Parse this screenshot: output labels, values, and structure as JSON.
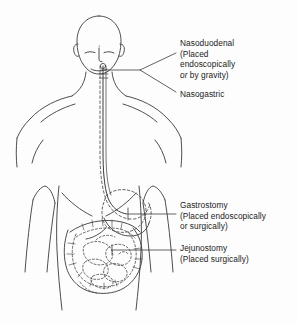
{
  "figure": {
    "background_color": "#fdfdfd",
    "ink_color": "#3a3a3a",
    "text_color": "#1a1a1a"
  },
  "labels": {
    "nasoduodenal": {
      "name": "Nasoduodenal",
      "detail_line1": "(Placed",
      "detail_line2": "endoscopically",
      "detail_italic": "or",
      "detail_line3": " by gravity)"
    },
    "nasogastric": {
      "name": "Nasogastric"
    },
    "gastrostomy": {
      "name": "Gastrostomy",
      "detail_line1": "(Placed endoscopically",
      "detail_line2": "or surgically)"
    },
    "jejunostomy": {
      "name": "Jejunostomy",
      "detail_line1": "(Placed surgically)"
    }
  },
  "anatomy": {
    "parts": [
      "head",
      "ear-left",
      "ear-right",
      "eyebrow-left",
      "eyebrow-right",
      "nose",
      "neck",
      "shoulder-left",
      "shoulder-right",
      "arm-left",
      "arm-right",
      "torso",
      "clavicle-left",
      "clavicle-right",
      "rib-margin-left",
      "rib-margin-right",
      "esophagus-tube",
      "stomach",
      "duodenum",
      "large-intestine",
      "small-intestine"
    ]
  }
}
